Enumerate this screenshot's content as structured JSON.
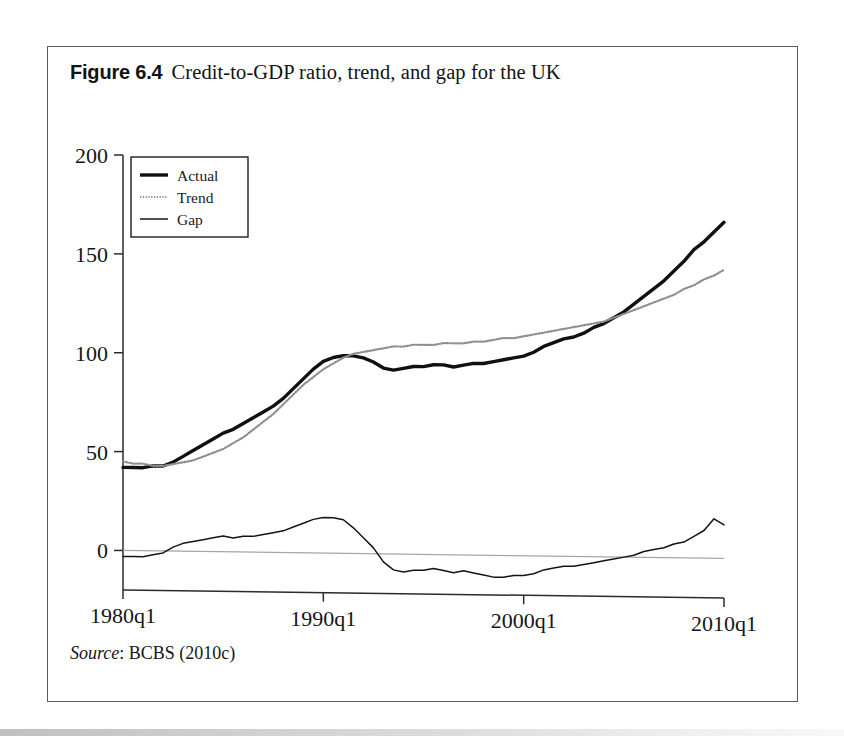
{
  "figure": {
    "label": "Figure 6.4",
    "title": "Credit-to-GDP ratio, trend, and gap for the UK",
    "source_word": "Source",
    "source_rest": ": BCBS (2010c)"
  },
  "chart_data": {
    "type": "line",
    "title": "Credit-to-GDP ratio, trend, and gap for the UK",
    "xlabel": "",
    "ylabel": "",
    "xlim": [
      1980,
      2010
    ],
    "ylim": [
      -20,
      200
    ],
    "grid": false,
    "legend_position": "top-left",
    "xticks": [
      1980,
      1990,
      2000,
      2010
    ],
    "xticklabels": [
      "1980q1",
      "1990q1",
      "2000q1",
      "2010q1"
    ],
    "yticks": [
      0,
      50,
      100,
      150,
      200
    ],
    "yticklabels": [
      "0",
      "50",
      "100",
      "150",
      "200"
    ],
    "zero_reference_line": 0,
    "x": [
      1980.0,
      1980.5,
      1981.0,
      1981.5,
      1982.0,
      1982.5,
      1983.0,
      1983.5,
      1984.0,
      1984.5,
      1985.0,
      1985.5,
      1986.0,
      1986.5,
      1987.0,
      1987.5,
      1988.0,
      1988.5,
      1989.0,
      1989.5,
      1990.0,
      1990.5,
      1991.0,
      1991.5,
      1992.0,
      1992.5,
      1993.0,
      1993.5,
      1994.0,
      1994.5,
      1995.0,
      1995.5,
      1996.0,
      1996.5,
      1997.0,
      1997.5,
      1998.0,
      1998.5,
      1999.0,
      1999.5,
      2000.0,
      2000.5,
      2001.0,
      2001.5,
      2002.0,
      2002.5,
      2003.0,
      2003.5,
      2004.0,
      2004.5,
      2005.0,
      2005.5,
      2006.0,
      2006.5,
      2007.0,
      2007.5,
      2008.0,
      2008.5,
      2009.0,
      2009.5,
      2010.0
    ],
    "series": [
      {
        "name": "Actual",
        "color": "#101012",
        "width": 3.4,
        "style": "solid",
        "values": [
          42,
          42,
          42,
          43,
          43,
          45,
          48,
          51,
          54,
          57,
          60,
          62,
          65,
          68,
          71,
          74,
          78,
          83,
          88,
          93,
          97,
          99,
          100,
          100,
          99,
          97,
          94,
          93,
          94,
          95,
          95,
          96,
          96,
          95,
          96,
          97,
          97,
          98,
          99,
          100,
          101,
          103,
          106,
          108,
          110,
          111,
          113,
          116,
          118,
          121,
          124,
          128,
          132,
          136,
          140,
          145,
          150,
          156,
          160,
          165,
          170
        ]
      },
      {
        "name": "Trend",
        "color": "#8e8e92",
        "width": 2.2,
        "style": "dotted",
        "values": [
          45,
          44,
          44,
          43,
          43,
          44,
          45,
          46,
          48,
          50,
          52,
          55,
          58,
          62,
          66,
          70,
          75,
          80,
          85,
          89,
          93,
          96,
          99,
          101,
          102,
          103,
          104,
          105,
          105,
          106,
          106,
          106,
          107,
          107,
          107,
          108,
          108,
          109,
          110,
          110,
          111,
          112,
          113,
          114,
          115,
          116,
          117,
          118,
          119,
          121,
          123,
          125,
          127,
          129,
          131,
          133,
          136,
          138,
          141,
          143,
          146
        ]
      },
      {
        "name": "Gap",
        "color": "#141416",
        "width": 1.5,
        "style": "solid",
        "values": [
          -3,
          -3,
          -3,
          -2,
          -1,
          2,
          4,
          5,
          6,
          7,
          8,
          7,
          8,
          8,
          9,
          10,
          11,
          13,
          15,
          17,
          18,
          18,
          17,
          13,
          8,
          3,
          -4,
          -8,
          -9,
          -8,
          -8,
          -7,
          -8,
          -9,
          -8,
          -9,
          -10,
          -11,
          -11,
          -10,
          -10,
          -9,
          -7,
          -6,
          -5,
          -5,
          -4,
          -3,
          -2,
          -1,
          0,
          1,
          3,
          4,
          5,
          7,
          8,
          11,
          14,
          20,
          17
        ]
      }
    ],
    "annotations": [
      {
        "text": "gap peak ~18 near 1990q1"
      },
      {
        "text": "gap trough ~-11 near 1998-1999"
      },
      {
        "text": "actual ends ~170, trend ends ~146 at 2010q1"
      }
    ]
  },
  "legend": {
    "items": [
      {
        "label": "Actual"
      },
      {
        "label": "Trend"
      },
      {
        "label": "Gap"
      }
    ]
  }
}
